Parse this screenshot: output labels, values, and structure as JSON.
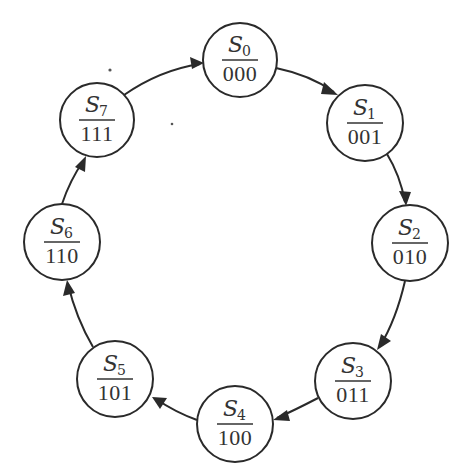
{
  "diagram": {
    "type": "state-diagram",
    "colors": {
      "stroke": "#2a2a2a",
      "text": "#333333",
      "background": "#ffffff"
    },
    "states": [
      {
        "id": "S0",
        "name": "S",
        "subscript": "0",
        "code": "000",
        "cx": 240,
        "cy": 60,
        "r": 37
      },
      {
        "id": "S1",
        "name": "S",
        "subscript": "1",
        "code": "001",
        "cx": 365,
        "cy": 123,
        "r": 38
      },
      {
        "id": "S2",
        "name": "S",
        "subscript": "2",
        "code": "010",
        "cx": 410,
        "cy": 243,
        "r": 38
      },
      {
        "id": "S3",
        "name": "S",
        "subscript": "3",
        "code": "011",
        "cx": 353,
        "cy": 381,
        "r": 38
      },
      {
        "id": "S4",
        "name": "S",
        "subscript": "4",
        "code": "100",
        "cx": 235,
        "cy": 424,
        "r": 38
      },
      {
        "id": "S5",
        "name": "S",
        "subscript": "5",
        "code": "101",
        "cx": 115,
        "cy": 379,
        "r": 38
      },
      {
        "id": "S6",
        "name": "S",
        "subscript": "6",
        "code": "110",
        "cx": 62,
        "cy": 242,
        "r": 38
      },
      {
        "id": "S7",
        "name": "S",
        "subscript": "7",
        "code": "111",
        "cx": 97,
        "cy": 120,
        "r": 37
      }
    ],
    "transitions": [
      {
        "from": "S0",
        "to": "S1"
      },
      {
        "from": "S1",
        "to": "S2"
      },
      {
        "from": "S2",
        "to": "S3"
      },
      {
        "from": "S3",
        "to": "S4"
      },
      {
        "from": "S4",
        "to": "S5"
      },
      {
        "from": "S5",
        "to": "S6"
      },
      {
        "from": "S6",
        "to": "S7"
      },
      {
        "from": "S7",
        "to": "S0"
      }
    ]
  }
}
